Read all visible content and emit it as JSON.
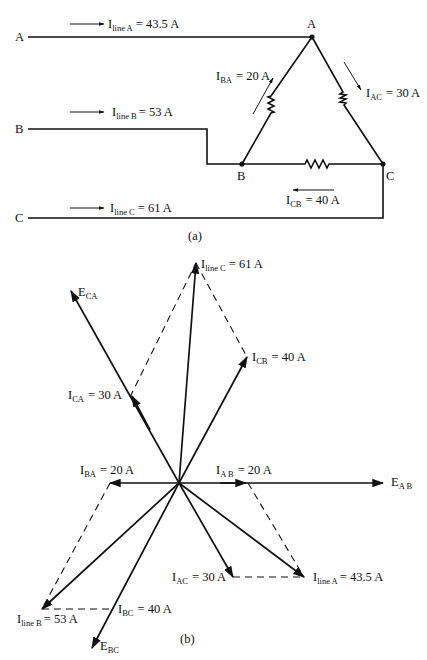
{
  "circuit": {
    "caption": "(a)",
    "terminals": {
      "a": "A",
      "b": "B",
      "c": "C"
    },
    "nodes": {
      "a": "A",
      "b": "B",
      "c": "C"
    },
    "line_currents": {
      "a": {
        "main": "I",
        "sub": "line A",
        "value": "= 43.5 A"
      },
      "b": {
        "main": "I",
        "sub": "line B",
        "value": "= 53 A"
      },
      "c": {
        "main": "I",
        "sub": "line C",
        "value": "= 61 A"
      }
    },
    "phase_currents": {
      "ba": {
        "main": "I",
        "sub": "BA",
        "value": "= 20 A"
      },
      "ac": {
        "main": "I",
        "sub": "AC",
        "value": "= 30 A"
      },
      "cb": {
        "main": "I",
        "sub": "CB",
        "value": "= 40 A"
      }
    }
  },
  "phasor": {
    "caption": "(b)",
    "labels": {
      "line_c": {
        "main": "I",
        "sub": "line C",
        "value": "= 61 A"
      },
      "e_ca": {
        "main": "E",
        "sub": "CA"
      },
      "i_ca": {
        "main": "I",
        "sub": "CA",
        "value": "= 30 A"
      },
      "i_cb": {
        "main": "I",
        "sub": "CB",
        "value": "= 40 A"
      },
      "i_ba": {
        "main": "I",
        "sub": "BA",
        "value": "= 20 A"
      },
      "i_ab": {
        "main": "I",
        "sub": "A B",
        "value": "= 20 A"
      },
      "e_ab": {
        "main": "E",
        "sub": "A B"
      },
      "i_ac": {
        "main": "I",
        "sub": "AC",
        "value": "= 30 A"
      },
      "line_a": {
        "main": "I",
        "sub": "line A",
        "value": "= 43.5 A"
      },
      "line_b": {
        "main": "I",
        "sub": "line B",
        "value": "= 53 A"
      },
      "i_bc": {
        "main": "I",
        "sub": "BC",
        "value": "= 40 A"
      },
      "e_bc": {
        "main": "E",
        "sub": "BC"
      }
    }
  }
}
